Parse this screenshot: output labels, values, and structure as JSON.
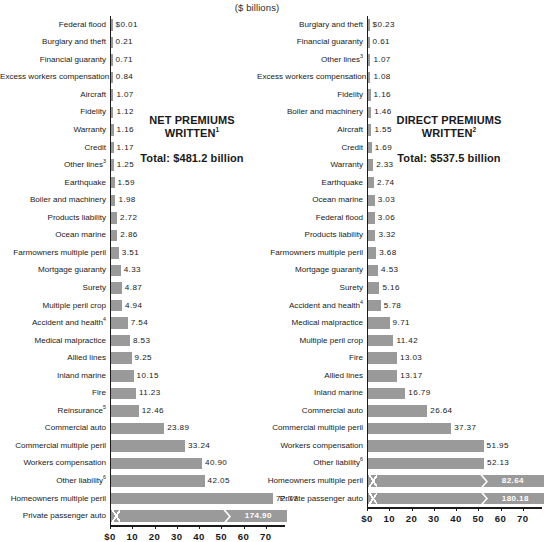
{
  "page": {
    "unit_title": "($ billions)",
    "bar_color": "#9a9a9a",
    "axis_color": "#1a1a1a",
    "text_color": "#1a1a1a"
  },
  "chart_data": [
    {
      "type": "bar",
      "orientation": "horizontal",
      "id": "net-premiums-written",
      "title": "NET PREMIUMS WRITTEN",
      "title_superscript": "1",
      "total_label": "Total: $481.2 billion",
      "total_value": 481.2,
      "subtitle": "($ billions)",
      "xlabel": "",
      "ylabel": "",
      "xlim": [
        0,
        77
      ],
      "grid": false,
      "legend": "none",
      "axis_ticks": [
        0,
        10,
        20,
        30,
        40,
        50,
        60,
        70
      ],
      "axis_tick_labels": [
        "$0",
        "10",
        "20",
        "30",
        "40",
        "50",
        "60",
        "70"
      ],
      "axis_break_note": "Bars for values above the axis maximum are drawn with a break marker",
      "categories": [
        "Federal flood",
        "Burglary and theft",
        "Financial guaranty",
        "Excess workers compensation",
        "Aircraft",
        "Fidelity",
        "Warranty",
        "Credit",
        "Other lines",
        "Earthquake",
        "Boiler and machinery",
        "Products liability",
        "Ocean marine",
        "Farmowners multiple peril",
        "Mortgage guaranty",
        "Surety",
        "Multiple peril crop",
        "Accident and health",
        "Medical malpractice",
        "Allied lines",
        "Inland marine",
        "Fire",
        "Reinsurance",
        "Commercial auto",
        "Commercial multiple peril",
        "Workers compensation",
        "Other liability",
        "Homeowners multiple peril",
        "Private passenger auto"
      ],
      "category_superscripts": {
        "Other lines": "3",
        "Accident and health": "4",
        "Reinsurance": "5",
        "Other liability": "6"
      },
      "values": [
        0.01,
        0.21,
        0.71,
        0.84,
        1.07,
        1.12,
        1.16,
        1.17,
        1.25,
        1.59,
        1.98,
        2.72,
        2.86,
        3.51,
        4.33,
        4.87,
        4.94,
        7.54,
        8.53,
        9.25,
        10.15,
        11.23,
        12.46,
        23.89,
        33.24,
        40.9,
        42.05,
        72.77,
        174.9
      ],
      "value_labels": [
        "$0.01",
        "0.21",
        "0.71",
        "0.84",
        "1.07",
        "1.12",
        "1.16",
        "1.17",
        "1.25",
        "1.59",
        "1.98",
        "2.72",
        "2.86",
        "3.51",
        "4.33",
        "4.87",
        "4.94",
        "7.54",
        "8.53",
        "9.25",
        "10.15",
        "11.23",
        "12.46",
        "23.89",
        "33.24",
        "40.90",
        "42.05",
        "72.77",
        "174.90"
      ]
    },
    {
      "type": "bar",
      "orientation": "horizontal",
      "id": "direct-premiums-written",
      "title": "DIRECT PREMIUMS WRITTEN",
      "title_superscript": "2",
      "total_label": "Total: $537.5 billion",
      "total_value": 537.5,
      "subtitle": "($ billions)",
      "xlabel": "",
      "ylabel": "",
      "xlim": [
        0,
        77
      ],
      "grid": false,
      "legend": "none",
      "axis_ticks": [
        0,
        10,
        20,
        30,
        40,
        50,
        60,
        70
      ],
      "axis_tick_labels": [
        "$0",
        "10",
        "20",
        "30",
        "40",
        "50",
        "60",
        "70"
      ],
      "categories": [
        "Burglary and theft",
        "Financial guaranty",
        "Other lines",
        "Excess workers compensation",
        "Fidelity",
        "Boiler and machinery",
        "Aircraft",
        "Credit",
        "Warranty",
        "Earthquake",
        "Ocean marine",
        "Federal flood",
        "Products liability",
        "Farmowners multiple peril",
        "Mortgage guaranty",
        "Surety",
        "Accident and health",
        "Medical malpractice",
        "Multiple peril crop",
        "Fire",
        "Allied lines",
        "Inland marine",
        "Commercial auto",
        "Commercial multiple peril",
        "Workers compensation",
        "Other liability",
        "Homeowners multiple peril",
        "Private passenger auto"
      ],
      "category_superscripts": {
        "Other lines": "3",
        "Accident and health": "4",
        "Other liability": "6"
      },
      "values": [
        0.23,
        0.61,
        1.07,
        1.08,
        1.16,
        1.46,
        1.55,
        1.69,
        2.33,
        2.74,
        3.03,
        3.06,
        3.32,
        3.68,
        4.53,
        5.16,
        5.78,
        9.71,
        11.42,
        13.03,
        13.17,
        16.79,
        26.64,
        37.37,
        51.95,
        52.13,
        82.64,
        180.18
      ],
      "value_labels": [
        "$0.23",
        "0.61",
        "1.07",
        "1.08",
        "1.16",
        "1.46",
        "1.55",
        "1.69",
        "2.33",
        "2.74",
        "3.03",
        "3.06",
        "3.32",
        "3.68",
        "4.53",
        "5.16",
        "5.78",
        "9.71",
        "11.42",
        "13.03",
        "13.17",
        "16.79",
        "26.64",
        "37.37",
        "51.95",
        "52.13",
        "82.64",
        "180.18"
      ]
    }
  ]
}
